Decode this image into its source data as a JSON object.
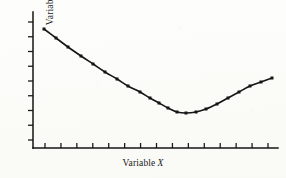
{
  "figure": {
    "background_color": "#fcfcfa",
    "ink_color": "#1b1b1b",
    "xlabel_word": "Variable",
    "xlabel_letter": "X",
    "ylabel_word": "Variable",
    "ylabel_letter": "Y"
  },
  "chart_data": {
    "type": "line",
    "title": "",
    "subtitle": "",
    "xlabel": "Variable X",
    "ylabel": "Variable Y",
    "legend": [],
    "legend_position": "none",
    "grid": false,
    "axis_style": "open-left-bottom",
    "x_tick_count": 15,
    "y_tick_count": 9,
    "x_tick_labels": [],
    "y_tick_labels": [],
    "xlim": [
      0,
      16
    ],
    "ylim": [
      0,
      10
    ],
    "marker": "square",
    "marker_color": "#151515",
    "line_color": "#151515",
    "line_width": 1.6,
    "x": [
      1,
      1.8,
      2.6,
      3.4,
      4.2,
      5.0,
      5.8,
      6.6,
      7.4,
      8.2,
      9.0,
      9.8,
      10.6,
      11.4,
      12.2,
      13.0,
      13.8,
      14.6,
      15.4
    ],
    "y": [
      9.1,
      8.35,
      7.65,
      7.0,
      6.4,
      5.85,
      5.35,
      4.95,
      4.6,
      4.35,
      4.18,
      4.1,
      4.1,
      4.2,
      4.42,
      4.78,
      5.25,
      5.85,
      6.55
    ],
    "series": [
      {
        "name": "Variable Y vs Variable X",
        "values": [
          9.1,
          8.35,
          7.65,
          7.0,
          6.4,
          5.85,
          5.35,
          4.95,
          4.6,
          4.35,
          4.18,
          4.1,
          4.1,
          4.2,
          4.42,
          4.78,
          5.25,
          5.85,
          6.55
        ]
      }
    ],
    "points_px": [
      [
        44,
        29
      ],
      [
        56,
        38
      ],
      [
        68,
        47
      ],
      [
        81,
        56
      ],
      [
        93,
        64
      ],
      [
        105,
        72
      ],
      [
        117,
        79
      ],
      [
        128,
        86
      ],
      [
        140,
        92
      ],
      [
        150,
        98
      ],
      [
        159,
        103
      ],
      [
        168,
        108
      ],
      [
        177,
        112
      ],
      [
        186,
        113
      ],
      [
        196,
        112
      ],
      [
        206,
        109
      ],
      [
        217,
        104
      ],
      [
        228,
        98
      ],
      [
        239,
        92
      ],
      [
        250,
        86
      ],
      [
        261,
        82
      ],
      [
        272,
        78
      ]
    ],
    "axes_px": {
      "x_axis_y": 148,
      "x_axis_x0": 33,
      "x_axis_x1": 278,
      "y_axis_x": 33,
      "y_axis_y0": 12,
      "y_axis_y1": 148
    }
  }
}
